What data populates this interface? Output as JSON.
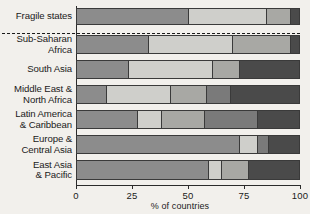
{
  "chart_data": {
    "type": "bar",
    "orientation": "horizontal",
    "stacked": true,
    "title": "",
    "xlabel": "% of countries",
    "ylabel": "",
    "xlim": [
      0,
      100
    ],
    "xticks": [
      0,
      25,
      50,
      75,
      100
    ],
    "xtick_labels": [
      "0",
      "25",
      "50",
      "75",
      "100"
    ],
    "grid": false,
    "legend": "none",
    "categories": [
      "Fragile states",
      "Sub-Saharan\nAfrica",
      "South Asia",
      "Middle East &\nNorth Africa",
      "Latin America\n& Caribbean",
      "Europe &\nCentral Asia",
      "East Asia\n& Pacific"
    ],
    "series": [
      {
        "name": "segment-1",
        "color": "#8c8c8c",
        "values": [
          50,
          32,
          23,
          13,
          27,
          73,
          59
        ]
      },
      {
        "name": "segment-2",
        "color": "#cfcfcb",
        "values": [
          35,
          38,
          38,
          29,
          11,
          8,
          6
        ]
      },
      {
        "name": "segment-3",
        "color": "#a8a8a4",
        "values": [
          11,
          26,
          12,
          16,
          19,
          0,
          12
        ]
      },
      {
        "name": "segment-4",
        "color": "#7a7a7a",
        "values": [
          0,
          0,
          0,
          11,
          24,
          5,
          0
        ]
      },
      {
        "name": "segment-5",
        "color": "#4a4a4a",
        "values": [
          4,
          4,
          27,
          31,
          19,
          14,
          23
        ]
      }
    ],
    "annotations": [
      {
        "type": "dashed-separator",
        "after_category": "Fragile states"
      }
    ]
  }
}
